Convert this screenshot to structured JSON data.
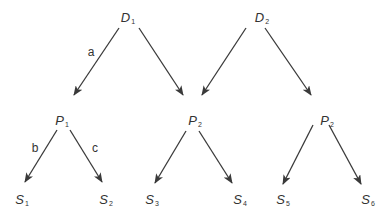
{
  "diagram": {
    "color": "#3a3a3a",
    "nodes": [
      {
        "id": "D1",
        "base": "D",
        "sub": "1",
        "x": 128,
        "y": 18
      },
      {
        "id": "D2",
        "base": "D",
        "sub": "2",
        "x": 262,
        "y": 18
      },
      {
        "id": "P1",
        "base": "P",
        "sub": "1",
        "x": 62,
        "y": 121
      },
      {
        "id": "P2a",
        "base": "P",
        "sub": "2",
        "x": 195,
        "y": 121
      },
      {
        "id": "P2b",
        "base": "P",
        "sub": "2",
        "x": 327,
        "y": 121
      },
      {
        "id": "S1",
        "base": "S",
        "sub": "1",
        "x": 22,
        "y": 200
      },
      {
        "id": "S2",
        "base": "S",
        "sub": "2",
        "x": 106,
        "y": 200
      },
      {
        "id": "S3",
        "base": "S",
        "sub": "3",
        "x": 152,
        "y": 200
      },
      {
        "id": "S4",
        "base": "S",
        "sub": "4",
        "x": 240,
        "y": 200
      },
      {
        "id": "S5",
        "base": "S",
        "sub": "5",
        "x": 283,
        "y": 200
      },
      {
        "id": "S6",
        "base": "S",
        "sub": "6",
        "x": 368,
        "y": 200
      }
    ],
    "edges": [
      {
        "from": "D1",
        "to": "P1",
        "x1": 119,
        "y1": 28,
        "x2": 74,
        "y2": 95,
        "label": "a",
        "lx": 91,
        "ly": 52
      },
      {
        "from": "D1",
        "to": "P2a",
        "x1": 139,
        "y1": 28,
        "x2": 183,
        "y2": 95,
        "label": ""
      },
      {
        "from": "D2",
        "to": "P2a",
        "x1": 246,
        "y1": 28,
        "x2": 202,
        "y2": 95,
        "label": ""
      },
      {
        "from": "D2",
        "to": "P2b",
        "x1": 265,
        "y1": 28,
        "x2": 311,
        "y2": 95,
        "label": ""
      },
      {
        "from": "P1",
        "to": "S1",
        "x1": 57,
        "y1": 130,
        "x2": 25,
        "y2": 182,
        "label": "b",
        "lx": 35,
        "ly": 148
      },
      {
        "from": "P1",
        "to": "S2",
        "x1": 70,
        "y1": 130,
        "x2": 102,
        "y2": 182,
        "label": "c",
        "lx": 95,
        "ly": 148
      },
      {
        "from": "P2a",
        "to": "S3",
        "x1": 186,
        "y1": 131,
        "x2": 155,
        "y2": 183,
        "label": ""
      },
      {
        "from": "P2a",
        "to": "S4",
        "x1": 199,
        "y1": 131,
        "x2": 232,
        "y2": 183,
        "label": ""
      },
      {
        "from": "P2b",
        "to": "S5",
        "x1": 313,
        "y1": 125,
        "x2": 283,
        "y2": 184,
        "label": ""
      },
      {
        "from": "P2b",
        "to": "S6",
        "x1": 329,
        "y1": 125,
        "x2": 361,
        "y2": 184,
        "label": ""
      }
    ]
  }
}
